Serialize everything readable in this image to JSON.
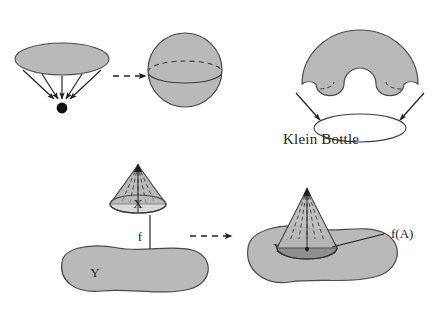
{
  "figure": {
    "background": "#ffffff",
    "ink": "#1f1f1f",
    "fill_light": "#b9b9b9",
    "fill_mid": "#b0b0b0",
    "fill_dark": "#8f8f8f",
    "fill_white": "#ffffff"
  },
  "panels": {
    "disk_to_sphere": {
      "name": "disk collapsed to a point yields a sphere",
      "source_shape": "shaded-ellipse-disk",
      "arrow_count": 5,
      "target_point": "filled-black-dot",
      "transition": "dashed-right-arrow",
      "result_shape": "shaded-sphere-with-equator"
    },
    "klein_bottle": {
      "name": "klein bottle construction",
      "label": "Klein Bottle",
      "dome_shape": "shaded-dome-with-notch",
      "arrow_count": 2,
      "base_shape": "white-ellipse"
    },
    "map_f": {
      "name": "map f from cone X to space Y",
      "domain_label": "X",
      "map_label": "f",
      "codomain_label": "Y",
      "domain_shape": "shaded-cone-with-dashed-generators",
      "codomain_shape": "shaded-blob",
      "transition": "dashed-right-arrow"
    },
    "image_fA": {
      "name": "image f(A) inside Y",
      "codomain_label": "Y",
      "image_label": "f(A)",
      "image_shape": "dark-ellipse-cone-base",
      "codomain_shape": "shaded-blob",
      "overlay_shape": "shaded-cone-with-dashed-generators"
    }
  },
  "labels": {
    "klein_bottle": "Klein Bottle",
    "x": "X",
    "f": "f",
    "y_left": "Y",
    "y_right": "Y",
    "f_of_a": "f(A)"
  }
}
